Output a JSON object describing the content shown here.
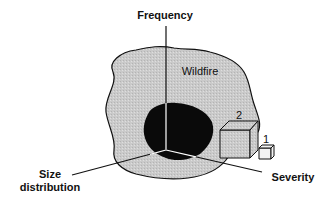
{
  "diagram": {
    "axes": {
      "vertical": "Frequency",
      "left_line1": "Size",
      "left_line2": "distribution",
      "right": "Severity"
    },
    "region_label": "Wildfire",
    "boxes": [
      {
        "label": "2"
      },
      {
        "label": "1"
      }
    ],
    "colors": {
      "wildfire_fill": "#c8c8c8",
      "core_fill": "#0a0a0a",
      "stroke": "#111111",
      "box_fill": "#ececec"
    }
  }
}
